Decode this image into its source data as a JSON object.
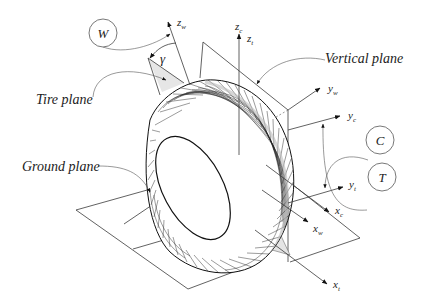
{
  "diagram": {
    "labels": {
      "tire_plane": "Tire plane",
      "vertical_plane": "Vertical plane",
      "ground_plane": "Ground plane",
      "camber_angle": "γ"
    },
    "frames": {
      "W": "W",
      "C": "C",
      "T": "T"
    },
    "axes": {
      "z_w": {
        "base": "z",
        "sub": "w"
      },
      "z_c": {
        "base": "z",
        "sub": "c"
      },
      "z_t": {
        "base": "z",
        "sub": "t"
      },
      "y_w": {
        "base": "y",
        "sub": "w"
      },
      "y_c": {
        "base": "y",
        "sub": "c"
      },
      "y_t": {
        "base": "y",
        "sub": "t"
      },
      "x_c": {
        "base": "x",
        "sub": "c"
      },
      "x_w": {
        "base": "x",
        "sub": "w"
      },
      "x_t": {
        "base": "x",
        "sub": "t"
      }
    },
    "colors": {
      "line": "#3a3a3a",
      "shade": "#e6e6e6",
      "background": "#ffffff"
    }
  }
}
